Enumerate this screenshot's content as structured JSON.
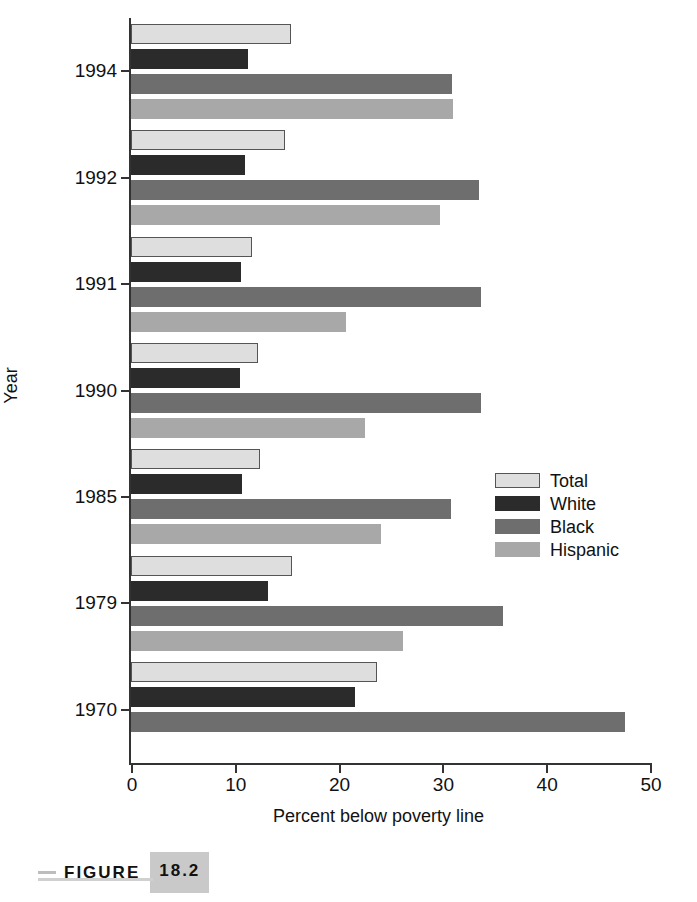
{
  "figure": {
    "caption_rule": "",
    "caption_word": "FIGURE",
    "caption_number": "18.2"
  },
  "chart_data": {
    "type": "bar",
    "orientation": "horizontal",
    "title": "",
    "xlabel": "Percent below poverty line",
    "ylabel": "Year",
    "xlim": [
      0,
      50
    ],
    "xticks": [
      0,
      10,
      20,
      30,
      40,
      50
    ],
    "xtick_labels": [
      "0",
      "10",
      "20",
      "30",
      "40",
      "50"
    ],
    "grid": false,
    "legend_position": "center-right",
    "categories": [
      "1994",
      "1992",
      "1991",
      "1990",
      "1985",
      "1979",
      "1970"
    ],
    "series": [
      {
        "name": "Total",
        "color": "#dedede",
        "values": [
          15.4,
          14.8,
          11.7,
          12.2,
          12.4,
          15.5,
          23.7
        ]
      },
      {
        "name": "White",
        "color": "#2b2b2b",
        "values": [
          11.3,
          11.0,
          10.6,
          10.5,
          10.7,
          13.2,
          21.6
        ]
      },
      {
        "name": "Black",
        "color": "#6e6e6e",
        "values": [
          30.9,
          33.5,
          33.7,
          33.7,
          30.8,
          35.8,
          47.6
        ]
      },
      {
        "name": "Hispanic",
        "color": "#a8a8a8",
        "values": [
          31.0,
          29.8,
          20.7,
          22.5,
          24.1,
          26.2,
          null
        ]
      }
    ]
  },
  "legend": {
    "items": [
      {
        "label": "Total",
        "color": "#dedede",
        "bordered": true
      },
      {
        "label": "White",
        "color": "#2b2b2b",
        "bordered": false
      },
      {
        "label": "Black",
        "color": "#6e6e6e",
        "bordered": false
      },
      {
        "label": "Hispanic",
        "color": "#a8a8a8",
        "bordered": false
      }
    ]
  }
}
